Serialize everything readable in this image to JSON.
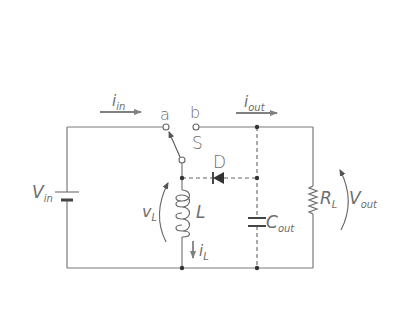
{
  "diagram": {
    "title": "",
    "type": "buck-boost converter schematic",
    "colors": {
      "wire": "#7a7a7a",
      "text": "#6e6e6e",
      "arrow": "#808080",
      "dot": "#333333"
    },
    "labels": {
      "i_in": {
        "main": "i",
        "sub": "in"
      },
      "i_out": {
        "main": "i",
        "sub": "out"
      },
      "terminal_a": "a",
      "terminal_b": "b",
      "switch": "S",
      "diode": "D",
      "v_in": {
        "main": "V",
        "sub": "in"
      },
      "v_L": {
        "main": "v",
        "sub": "L"
      },
      "inductor": "L",
      "i_L": {
        "main": "i",
        "sub": "L"
      },
      "capacitor": {
        "main": "C",
        "sub": "out"
      },
      "resistor": {
        "main": "R",
        "sub": "L"
      },
      "v_out": {
        "main": "V",
        "sub": "out"
      }
    },
    "components": [
      {
        "id": "Vin",
        "kind": "battery"
      },
      {
        "id": "S",
        "kind": "spdt-switch",
        "terminals": [
          "a",
          "b"
        ]
      },
      {
        "id": "D",
        "kind": "diode"
      },
      {
        "id": "L",
        "kind": "inductor"
      },
      {
        "id": "Cout",
        "kind": "capacitor"
      },
      {
        "id": "RL",
        "kind": "resistor"
      }
    ]
  }
}
